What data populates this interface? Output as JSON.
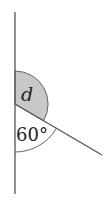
{
  "diagram": {
    "type": "angle-diagram",
    "vertex": [
      15,
      104
    ],
    "vertical_line": {
      "from": [
        15,
        12
      ],
      "to": [
        15,
        194
      ]
    },
    "ray": {
      "from": [
        15,
        104
      ],
      "to": [
        102,
        155
      ]
    },
    "angles": [
      {
        "label": "d",
        "shaded": true,
        "fill": "#c8c8c8",
        "radius": 33
      },
      {
        "label": "60°",
        "shaded": false,
        "radius": 48
      }
    ],
    "line_color": "#555555"
  }
}
